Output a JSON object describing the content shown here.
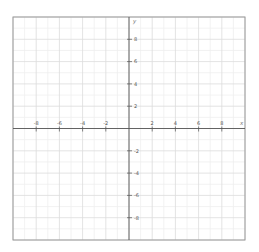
{
  "chart_data": {
    "type": "scatter",
    "title": "",
    "xlabel": "x",
    "ylabel": "y",
    "xlim": [
      -10,
      10
    ],
    "ylim": [
      -10,
      10
    ],
    "grid": true,
    "minor_grid_step": 1,
    "major_grid_step": 2,
    "x_ticks": [
      -8,
      -6,
      -4,
      -2,
      2,
      4,
      6,
      8
    ],
    "y_ticks": [
      8,
      6,
      4,
      2,
      -2,
      -4,
      -6,
      -8
    ],
    "x_tick_labels": [
      "-8",
      "-6",
      "-4",
      "-2",
      "2",
      "4",
      "6",
      "8"
    ],
    "y_tick_labels": [
      "8",
      "6",
      "4",
      "2",
      "-2",
      "-4",
      "-6",
      "-8"
    ],
    "series": [],
    "legend": null
  },
  "style": {
    "border_color": "#9a9a9a",
    "axis_color": "#555555",
    "minor_grid_color": "#efefef",
    "major_grid_color": "#dcdcdc",
    "tick_color": "#555555"
  },
  "layout": {
    "left": 13,
    "top": 17,
    "right": 245,
    "bottom": 240
  }
}
